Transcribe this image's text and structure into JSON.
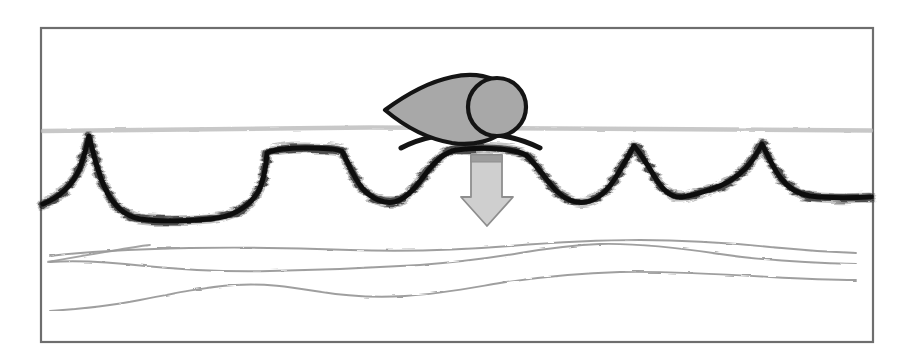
{
  "figure": {
    "canvas": {
      "width": 899,
      "height": 361,
      "background": "#ffffff"
    },
    "frame": {
      "name": "figure-border",
      "x": 41,
      "y": 28,
      "width": 832,
      "height": 314,
      "stroke": "#6e6e6e",
      "stroke_width": 2.2,
      "fill": "#ffffff"
    },
    "colors": {
      "border": "#6e6e6e",
      "water_surface": "#b9b9b9",
      "seabed_horizon": "#0d0d0d",
      "subsurface_horizon": "#9a9a9a",
      "vessel_fill": "#a8a8a8",
      "vessel_stroke": "#141414",
      "arrow_fill": "#cfcfcf",
      "arrow_stroke": "#8e8e8e",
      "arrow_cap": "#9c9c9c"
    },
    "water_surface": {
      "label": "water surface reflector",
      "y": 129,
      "x_start": 43,
      "x_end": 871,
      "stroke_width": 4.5,
      "opacity": 0.72,
      "path": "M 43,131 C 150,129.2 260,128.0 370,127.6 C 470,127.3 560,128.2 650,129.0 C 740,129.8 810,130.2 871,130.4"
    },
    "seabed_horizon": {
      "label": "seabed / high-amplitude reflector",
      "description": "thick black irregular reflector with sharp peaks and troughs",
      "stroke_width": 5.5,
      "path": "M 43,204 C 58,198 72,186 80,168 C 85,154 88,141 89,136 C 92,148 97,170 104,186 C 112,204 124,216 140,219 C 160,222 186,221 210,219 C 232,217 248,208 258,192 C 264,181 266,166 267,153 C 274,149 288,148 306,148 C 324,148 336,149 342,151 C 348,163 354,178 362,188 C 372,199 384,204 394,202 C 404,200 414,190 424,176 C 434,162 444,152 456,150 C 470,148 486,148 500,149 C 512,150 520,152 526,155 C 534,162 542,174 552,186 C 562,198 574,204 586,202 C 598,200 608,190 616,177 C 624,164 630,153 634,146 C 640,152 648,166 656,179 C 664,192 672,198 682,197 C 692,196 702,192 712,189 C 722,186 734,180 746,168 C 754,159 759,150 762,144 C 766,152 772,166 780,177 C 788,188 798,194 810,196 C 826,198 848,198 871,197"
    },
    "subsurface_horizons": [
      {
        "name": "subsurface-horizon-1",
        "stroke_width": 1.9,
        "path": "M 50,256 C 90,251 140,249 190,248 C 250,247 300,248 350,250 C 410,252 460,250 510,246 C 560,242 600,240 640,240 C 690,240 730,243 770,247 C 800,250 830,252 856,253"
      },
      {
        "name": "subsurface-horizon-2",
        "stroke_width": 1.9,
        "path": "M 50,262 C 80,260 110,262 145,266 C 185,270 225,272 270,271 C 320,270 370,268 420,265 C 460,262 490,258 520,253 C 550,248 575,245 600,244 C 640,243 680,248 720,254 C 760,260 810,263 856,264"
      },
      {
        "name": "subsurface-horizon-3",
        "stroke_width": 1.9,
        "path": "M 50,311 C 80,309 110,306 140,300 C 175,293 205,287 235,285 C 265,283 290,287 315,291 C 345,296 375,298 405,296 C 440,294 470,288 500,283 C 540,277 580,273 620,272 C 670,271 720,274 770,277 C 805,279 832,280 856,280"
      },
      {
        "name": "subsurface-horizon-stub",
        "stroke_width": 1.8,
        "path": "M 48,262 C 70,258 92,254 112,251 C 128,248 140,246 150,245"
      }
    ],
    "vessel": {
      "name": "survey-vessel-symbol",
      "description": "teardrop hull with circular tow body, sitting on the water surface",
      "hull_path": "M 385,110 C 404,96 428,82 452,77 C 474,72 494,76 506,88 C 516,99 516,118 506,129 C 494,141 474,146 452,143 C 428,139 404,126 385,110 Z",
      "circle": {
        "cx": 497,
        "cy": 107,
        "r": 29
      },
      "mast_path": "M 401,148 C 420,138 444,133 470,133 C 496,133 520,138 540,148",
      "fill": "#a8a8a8",
      "stroke": "#141414",
      "stroke_width": 4.2
    },
    "arrow": {
      "name": "downward-source-arrow",
      "description": "light grey block arrow pointing down from the vessel",
      "body_path": "M 471,155 L 502,155 L 502,197 L 513,197 L 487,226 L 461,197 L 471,197 Z",
      "cap_path": "M 471,155 L 502,155 L 502,162 L 471,162 Z",
      "fill": "#cfcfcf",
      "stroke": "#8e8e8e",
      "stroke_width": 1.8,
      "cap_fill": "#9c9c9c"
    }
  }
}
